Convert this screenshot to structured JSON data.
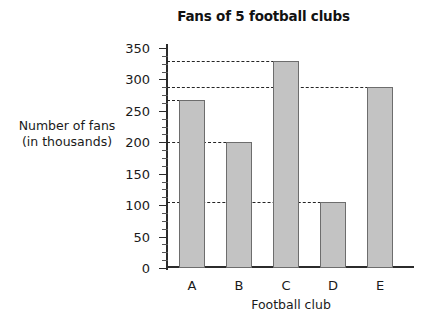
{
  "chart_data": {
    "type": "bar",
    "title": "Fans of 5 football clubs",
    "xlabel": "Football club",
    "ylabel": "Number of fans (in thousands)",
    "ylabel_line1": "Number of fans",
    "ylabel_line2": "(in thousands)",
    "categories": [
      "A",
      "B",
      "C",
      "D",
      "E"
    ],
    "values": [
      268,
      200,
      330,
      105,
      288
    ],
    "ylim": [
      0,
      350
    ],
    "ytick_labels": [
      "0",
      "50",
      "100",
      "150",
      "200",
      "250",
      "300",
      "350"
    ],
    "ytick_values": [
      0,
      50,
      100,
      150,
      200,
      250,
      300,
      350
    ],
    "minor_tick_step": 12.5,
    "grid": "dashed horizontal leader lines drawn from y-axis to the top of each bar",
    "gridline_values": [
      330,
      288,
      268,
      200,
      105
    ],
    "legend": null,
    "bar_color": "#c3c3c3",
    "bar_border_color": "#6d6d6d",
    "axis_color": "#2b2b2b",
    "background_color": "#ffffff"
  }
}
